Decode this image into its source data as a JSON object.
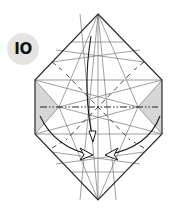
{
  "step": {
    "number_label": "IO",
    "badge_color": "#e4e4e4"
  },
  "diagram": {
    "colors": {
      "outline": "#2a2a2a",
      "crease": "#6e6e6e",
      "shade": "#d6d6d6",
      "arrow": "#1a1a1a"
    },
    "fold_line_type": "mountain (dash-dot)",
    "arrows": [
      "top-point-down-arrow",
      "left-flap-swing-arrow",
      "right-flap-swing-arrow"
    ]
  }
}
